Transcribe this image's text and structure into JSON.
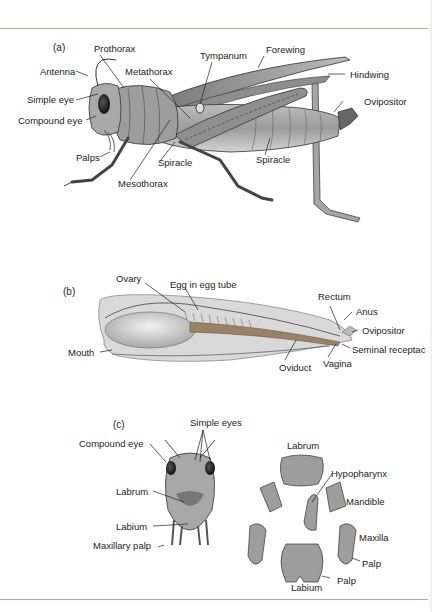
{
  "figure": {
    "panels": [
      {
        "id": "a",
        "label": "(a)",
        "title": "External anatomy of grasshopper (lateral view)",
        "labels": {
          "prothorax": "Prothorax",
          "tympanum": "Tympanum",
          "forewing": "Forewing",
          "antenna": "Antenna",
          "metathorax": "Metathorax",
          "hindwing": "Hindwing",
          "simple_eye": "Simple eye",
          "ovipositor": "Ovipositor",
          "compound_eye": "Compound eye",
          "palps": "Palps",
          "spiracle_1": "Spiracle",
          "spiracle_2": "Spiracle",
          "mesothorax": "Mesothorax"
        }
      },
      {
        "id": "b",
        "label": "(b)",
        "title": "Internal reproductive anatomy",
        "labels": {
          "ovary": "Ovary",
          "egg_in_egg_tube": "Egg in egg tube",
          "rectum": "Rectum",
          "anus": "Anus",
          "ovipositor": "Ovipositor",
          "mouth": "Mouth",
          "seminal_receptacle": "Seminal receptac",
          "oviduct": "Oviduct",
          "vagina": "Vagina"
        }
      },
      {
        "id": "c",
        "label": "(c)",
        "title": "Head and mouthparts",
        "labels": {
          "simple_eyes": "Simple eyes",
          "compound_eye": "Compound eye",
          "labrum_head": "Labrum",
          "labium_head": "Labium",
          "maxillary_palp": "Maxillary palp",
          "labrum": "Labrum",
          "hypopharynx": "Hypopharynx",
          "mandible": "Mandible",
          "maxilla": "Maxilla",
          "palp_1": "Palp",
          "palp_2": "Palp",
          "labium": "Labium"
        }
      }
    ],
    "colors": {
      "rule": "#b9a892",
      "ink": "#1d1d1d",
      "body_gray": "#8e8e8e",
      "tube_brown": "#9a8266"
    }
  }
}
